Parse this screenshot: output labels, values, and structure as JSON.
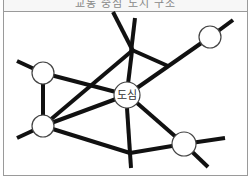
{
  "diagram": {
    "title": "교통 중심 도시 구조",
    "title_note": "title text partially cut off at top edge",
    "center_node": {
      "label": "도심",
      "x": 127,
      "y": 95,
      "r": 13
    },
    "nodes": [
      {
        "id": "top-right",
        "x": 210,
        "y": 37,
        "r": 11
      },
      {
        "id": "left-top",
        "x": 43,
        "y": 73,
        "r": 11
      },
      {
        "id": "left-bottom",
        "x": 43,
        "y": 126,
        "r": 11
      },
      {
        "id": "bottom-right",
        "x": 184,
        "y": 144,
        "r": 12
      }
    ],
    "line_color": "#111111",
    "node_stroke": "#444444"
  }
}
